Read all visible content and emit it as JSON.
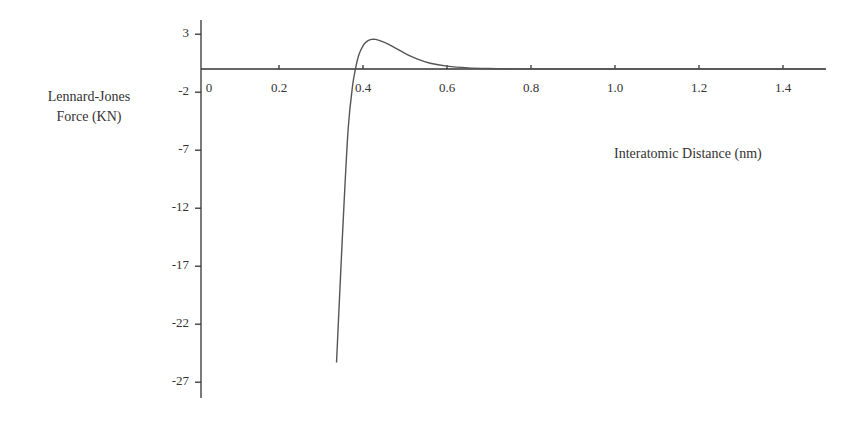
{
  "chart_data": {
    "type": "line",
    "title": "",
    "xlabel": "Interatomic Distance (nm)",
    "ylabel_lines": [
      "Lennard-Jones",
      "Force (KN)"
    ],
    "ylabel": "Lennard-Jones Force (KN)",
    "xlim": [
      0,
      1.5
    ],
    "ylim": [
      -28.5,
      4
    ],
    "x_ticks": [
      "0",
      "0.2",
      "0.4",
      "0.6",
      "0.8",
      "1.0",
      "1.2",
      "1.4"
    ],
    "x_tick_values": [
      0,
      0.2,
      0.4,
      0.6,
      0.8,
      1.0,
      1.2,
      1.4
    ],
    "y_ticks": [
      "3",
      "-2",
      "-7",
      "-12",
      "-17",
      "-22",
      "-27"
    ],
    "y_tick_values": [
      3,
      -2,
      -7,
      -12,
      -17,
      -22,
      -27
    ],
    "grid": false,
    "legend": null,
    "series": [
      {
        "name": "Lennard-Jones Force",
        "color": "#555555",
        "x": [
          0.337,
          0.345,
          0.355,
          0.365,
          0.375,
          0.382,
          0.39,
          0.4,
          0.41,
          0.42,
          0.43,
          0.44,
          0.46,
          0.48,
          0.5,
          0.53,
          0.56,
          0.6,
          0.65,
          0.7,
          0.75,
          0.8,
          0.9,
          1.0,
          1.2,
          1.5
        ],
        "y": [
          -25.3,
          -19.0,
          -11.5,
          -5.0,
          -1.5,
          0.0,
          1.2,
          2.0,
          2.4,
          2.55,
          2.55,
          2.45,
          2.15,
          1.75,
          1.35,
          0.85,
          0.5,
          0.25,
          0.1,
          0.04,
          0.015,
          0.0,
          0.0,
          0.0,
          0.0,
          0.0
        ]
      }
    ]
  }
}
